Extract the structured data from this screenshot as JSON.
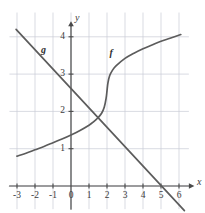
{
  "figure": {
    "kind": "cartesian-graph",
    "background": "#ffffff",
    "grid_color": "#c9cbd6",
    "axis_color": "#4a4a4a",
    "curve_color": "#5c5c5c",
    "text_color": "#3b3b3b"
  },
  "axes": {
    "x_axis_label": "x",
    "y_axis_label": "y",
    "x_ticks": [
      "-3",
      "-2",
      "-1",
      "0",
      "1",
      "2",
      "3",
      "4",
      "5",
      "6"
    ],
    "x_tick_values": [
      -3,
      -2,
      -1,
      0,
      1,
      2,
      3,
      4,
      5,
      6
    ],
    "y_ticks": [
      "1",
      "2",
      "3",
      "4"
    ],
    "y_tick_values": [
      1,
      2,
      3,
      4
    ],
    "xlim": [
      -3.4,
      6.6
    ],
    "ylim": [
      -0.6,
      4.6
    ],
    "grid": true
  },
  "curve_labels": {
    "g": "g",
    "f": "f"
  },
  "chart_data": {
    "type": "line",
    "title": "",
    "xlabel": "x",
    "ylabel": "y",
    "xlim": [
      -3.4,
      6.6
    ],
    "ylim": [
      -0.6,
      4.6
    ],
    "grid": true,
    "legend": "inline-labels",
    "series": [
      {
        "name": "f",
        "label": "f",
        "description": "increasing S-shaped (cube-root-like) curve with steep rise near x=2",
        "points": [
          [
            -3.0,
            0.8
          ],
          [
            -2.5,
            0.88
          ],
          [
            -2.0,
            0.97
          ],
          [
            -1.5,
            1.06
          ],
          [
            -1.0,
            1.16
          ],
          [
            -0.5,
            1.26
          ],
          [
            0.0,
            1.37
          ],
          [
            0.5,
            1.49
          ],
          [
            1.0,
            1.63
          ],
          [
            1.25,
            1.72
          ],
          [
            1.5,
            1.83
          ],
          [
            1.7,
            1.95
          ],
          [
            1.85,
            2.12
          ],
          [
            1.95,
            2.35
          ],
          [
            2.0,
            2.55
          ],
          [
            2.05,
            2.76
          ],
          [
            2.15,
            2.96
          ],
          [
            2.3,
            3.1
          ],
          [
            2.5,
            3.22
          ],
          [
            3.0,
            3.42
          ],
          [
            3.5,
            3.56
          ],
          [
            4.0,
            3.68
          ],
          [
            4.5,
            3.78
          ],
          [
            5.0,
            3.88
          ],
          [
            5.5,
            3.96
          ],
          [
            6.1,
            4.06
          ]
        ]
      },
      {
        "name": "g",
        "label": "g",
        "description": "decreasing straight line, slope about -0.52, y-intercept about 2.62",
        "slope": -0.52,
        "intercept": 2.62,
        "points": [
          [
            -3.05,
            4.2
          ],
          [
            6.3,
            -0.66
          ]
        ],
        "x_intercept": 5.05,
        "y_intercept": 2.62
      }
    ],
    "intersection": [
      1.78,
      1.9
    ]
  }
}
